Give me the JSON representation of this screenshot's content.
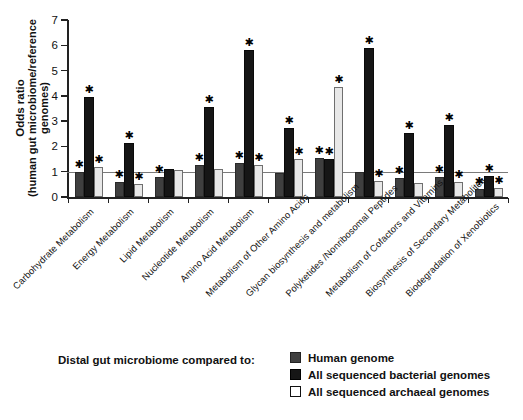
{
  "chart_data": {
    "type": "bar",
    "title": "",
    "subtitle": "",
    "xlabel": "",
    "ylabel": "Odds ratio",
    "ylabel_line2": "(human gut microbiome/reference genomes)",
    "ylim": [
      0,
      7
    ],
    "yticks": [
      0,
      1,
      2,
      3,
      4,
      5,
      6,
      7
    ],
    "grid": false,
    "reference_line": 1,
    "legend_position": "bottom",
    "legend_title": "Distal gut microbiome compared to:",
    "significance_marker": "✱",
    "categories": [
      "Carbohydrate Metabolism",
      "Energy Metabolism",
      "Lipid Metabolism",
      "Nucleotide Metabolism",
      "Amino Acid Metabolism",
      "Metabolism of Other Amino Acids",
      "Glycan biosynthesis and metabolism",
      "Polyketides /Nonribosomal Peptides",
      "Metabolism of Cofactors and Vitamins",
      "Biosynthesis of Secondary Metabolites",
      "Biodegradation of Xenobiotics"
    ],
    "series": [
      {
        "name": "Human genome",
        "color": "#3f3f3f",
        "values": [
          1.0,
          0.6,
          0.78,
          1.28,
          1.35,
          0.95,
          1.55,
          1.0,
          0.75,
          0.8,
          0.3
        ],
        "significant": [
          true,
          true,
          true,
          true,
          true,
          false,
          true,
          false,
          true,
          true,
          true
        ]
      },
      {
        "name": "All sequenced bacterial genomes",
        "color": "#161616",
        "values": [
          3.95,
          2.15,
          1.1,
          3.55,
          5.8,
          2.75,
          1.5,
          5.9,
          2.55,
          2.85,
          0.85
        ],
        "significant": [
          true,
          true,
          false,
          true,
          true,
          true,
          true,
          true,
          true,
          true,
          true
        ]
      },
      {
        "name": "All sequenced archaeal genomes",
        "color": "#e8e8e8",
        "values": [
          1.2,
          0.5,
          1.08,
          1.12,
          1.25,
          1.5,
          4.35,
          0.65,
          0.55,
          0.6,
          0.35
        ],
        "significant": [
          true,
          true,
          false,
          false,
          true,
          true,
          true,
          true,
          false,
          true,
          true
        ]
      }
    ]
  },
  "legend": {
    "lead_text": "Distal gut microbiome compared to:",
    "items": [
      {
        "label": "Human genome",
        "swatch": "sw0"
      },
      {
        "label": "All sequenced bacterial genomes",
        "swatch": "sw1"
      },
      {
        "label": "All sequenced archaeal genomes",
        "swatch": "sw2"
      }
    ]
  },
  "axis": {
    "y_title_line1": "Odds ratio",
    "y_title_line2": "(human gut microbiome/reference genomes)",
    "y_tick_labels": [
      "0",
      "1",
      "2",
      "3",
      "4",
      "5",
      "6",
      "7"
    ]
  }
}
